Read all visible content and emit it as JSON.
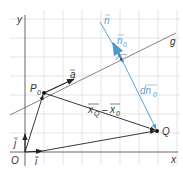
{
  "diagram": {
    "colors": {
      "grid": "#e4e4e4",
      "axis": "#555555",
      "vector": "#222222",
      "line": "#555555",
      "normal": "#4a9bd0",
      "label": "#333333",
      "label_blue": "#5a9fcf"
    },
    "axes": {
      "x_label": "x",
      "y_label": "y",
      "origin_label": "O"
    },
    "points": {
      "origin": {
        "label": "O",
        "x": 25,
        "y": 152
      },
      "p0": {
        "label": "P",
        "sub": "0",
        "x": 44,
        "y": 93
      },
      "q": {
        "label": "Q",
        "x": 157,
        "y": 131
      }
    },
    "lines": {
      "g": {
        "label": "g"
      },
      "normal": {
        "label": "n"
      }
    },
    "vectors": {
      "i": {
        "label": "i"
      },
      "j": {
        "label": "j"
      },
      "a": {
        "label": "a"
      },
      "n0": {
        "label": "n",
        "sub": "0"
      },
      "dn0": {
        "label": "dn",
        "sub": "0"
      },
      "xq_minus_x0": {
        "label_q": "x",
        "sub_q": "Q",
        "minus": "–",
        "label_0": "x",
        "sub_0": "0"
      }
    },
    "annotations": {
      "right_angle_dot": "·"
    }
  }
}
